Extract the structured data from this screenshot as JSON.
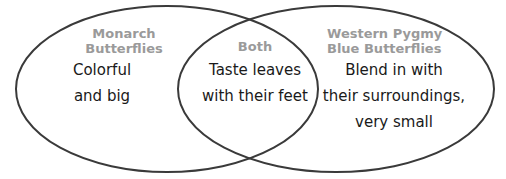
{
  "diagram": {
    "type": "venn",
    "stroke_color": "#3a3a3a",
    "label_color": "#9a9a9a",
    "text_color": "#1a1a1a",
    "sets": [
      {
        "id": "left",
        "label_lines": [
          "Monarch",
          "Butterflies"
        ],
        "text_lines": [
          "Colorful",
          "and big"
        ]
      },
      {
        "id": "overlap",
        "label_lines": [
          "Both"
        ],
        "text_lines": [
          "Taste leaves",
          "with their feet"
        ]
      },
      {
        "id": "right",
        "label_lines": [
          "Western Pygmy",
          "Blue Butterflies"
        ],
        "text_lines": [
          "Blend in with",
          "their surroundings,",
          "very small"
        ]
      }
    ]
  }
}
